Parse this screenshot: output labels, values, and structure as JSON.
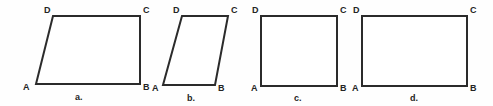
{
  "figure": {
    "background_color": "#fefefe",
    "stroke_color": "#2b2b2b",
    "label_color": "#242424",
    "width": 493,
    "height": 106
  },
  "shapes": [
    {
      "caption": "a.",
      "kind": "parallelogram",
      "points": "36,84 140,84 140,16 53,16",
      "polygon": [
        {
          "name": "A",
          "x": 36,
          "y": 84
        },
        {
          "name": "B",
          "x": 140,
          "y": 84
        },
        {
          "name": "C",
          "x": 140,
          "y": 16
        },
        {
          "name": "D",
          "x": 53,
          "y": 16
        }
      ],
      "vertex_labels": [
        {
          "text": "D",
          "x": 44,
          "y": 6
        },
        {
          "text": "C",
          "x": 143,
          "y": 6
        },
        {
          "text": "A",
          "x": 23,
          "y": 83
        },
        {
          "text": "B",
          "x": 143,
          "y": 83
        }
      ],
      "caption_pos": {
        "x": 75,
        "y": 93
      }
    },
    {
      "caption": "b.",
      "kind": "parallelogram",
      "points": "163,85 215,85 228,16 182,16",
      "polygon": [
        {
          "name": "A",
          "x": 163,
          "y": 85
        },
        {
          "name": "B",
          "x": 215,
          "y": 85
        },
        {
          "name": "C",
          "x": 228,
          "y": 16
        },
        {
          "name": "D",
          "x": 182,
          "y": 16
        }
      ],
      "vertex_labels": [
        {
          "text": "D",
          "x": 173,
          "y": 6
        },
        {
          "text": "C",
          "x": 231,
          "y": 6
        },
        {
          "text": "A",
          "x": 152,
          "y": 84
        },
        {
          "text": "B",
          "x": 218,
          "y": 84
        }
      ],
      "caption_pos": {
        "x": 187,
        "y": 94
      }
    },
    {
      "caption": "c.",
      "kind": "square",
      "points": "261,86 337,86 337,16 261,16",
      "polygon": [
        {
          "name": "A",
          "x": 261,
          "y": 86
        },
        {
          "name": "B",
          "x": 337,
          "y": 86
        },
        {
          "name": "C",
          "x": 337,
          "y": 16
        },
        {
          "name": "D",
          "x": 261,
          "y": 16
        }
      ],
      "vertex_labels": [
        {
          "text": "D",
          "x": 252,
          "y": 6
        },
        {
          "text": "C",
          "x": 340,
          "y": 6
        },
        {
          "text": "A",
          "x": 251,
          "y": 84
        },
        {
          "text": "B",
          "x": 340,
          "y": 84
        }
      ],
      "caption_pos": {
        "x": 294,
        "y": 94
      }
    },
    {
      "caption": "d.",
      "kind": "rectangle",
      "points": "362,86 467,86 467,16 362,16",
      "polygon": [
        {
          "name": "A",
          "x": 362,
          "y": 86
        },
        {
          "name": "B",
          "x": 467,
          "y": 86
        },
        {
          "name": "C",
          "x": 467,
          "y": 16
        },
        {
          "name": "D",
          "x": 362,
          "y": 16
        }
      ],
      "vertex_labels": [
        {
          "text": "D",
          "x": 353,
          "y": 6
        },
        {
          "text": "C",
          "x": 470,
          "y": 6
        },
        {
          "text": "A",
          "x": 352,
          "y": 84
        },
        {
          "text": "B",
          "x": 470,
          "y": 84
        }
      ],
      "caption_pos": {
        "x": 410,
        "y": 94
      }
    }
  ]
}
